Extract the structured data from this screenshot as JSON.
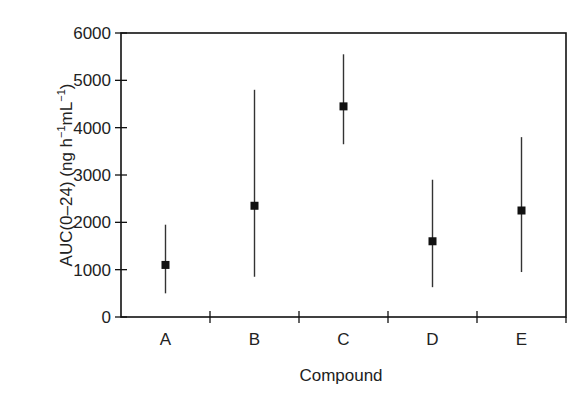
{
  "chart_data": {
    "type": "scatter",
    "subtype": "point-with-range-errorbars",
    "title": "",
    "xlabel": "Compound",
    "ylabel": "AUC(0–24) (ng h⁻¹mL⁻¹)",
    "ylabel_parts": {
      "main": "AUC(0–24) (ng h",
      "sup1": "−1",
      "mid": "mL",
      "sup2": "−1",
      "end": ")"
    },
    "categories": [
      "A",
      "B",
      "C",
      "D",
      "E"
    ],
    "series": [
      {
        "name": "AUC(0-24)",
        "values": [
          1100,
          2350,
          4450,
          1600,
          2250
        ],
        "lower": [
          500,
          850,
          3650,
          630,
          950
        ],
        "upper": [
          1950,
          4800,
          5550,
          2900,
          3800
        ]
      }
    ],
    "ylim": [
      0,
      6000
    ],
    "yticks": [
      0,
      1000,
      2000,
      3000,
      4000,
      5000,
      6000
    ],
    "ytick_labels": [
      "0",
      "1000",
      "2000",
      "3000",
      "4000",
      "5000",
      "6000"
    ],
    "grid": false,
    "legend": null,
    "frame": "box",
    "marker": "square",
    "color": "#111111"
  }
}
